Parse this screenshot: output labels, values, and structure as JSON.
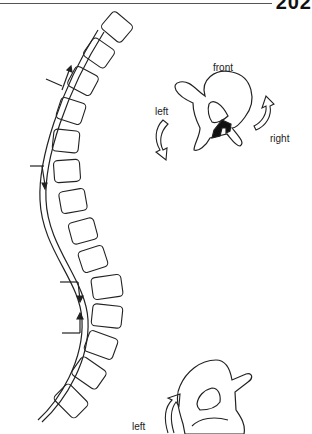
{
  "page": {
    "number": "202"
  },
  "figure": {
    "labels": {
      "front": "front",
      "left_top": "left",
      "right": "right",
      "left_bottom": "left"
    }
  }
}
